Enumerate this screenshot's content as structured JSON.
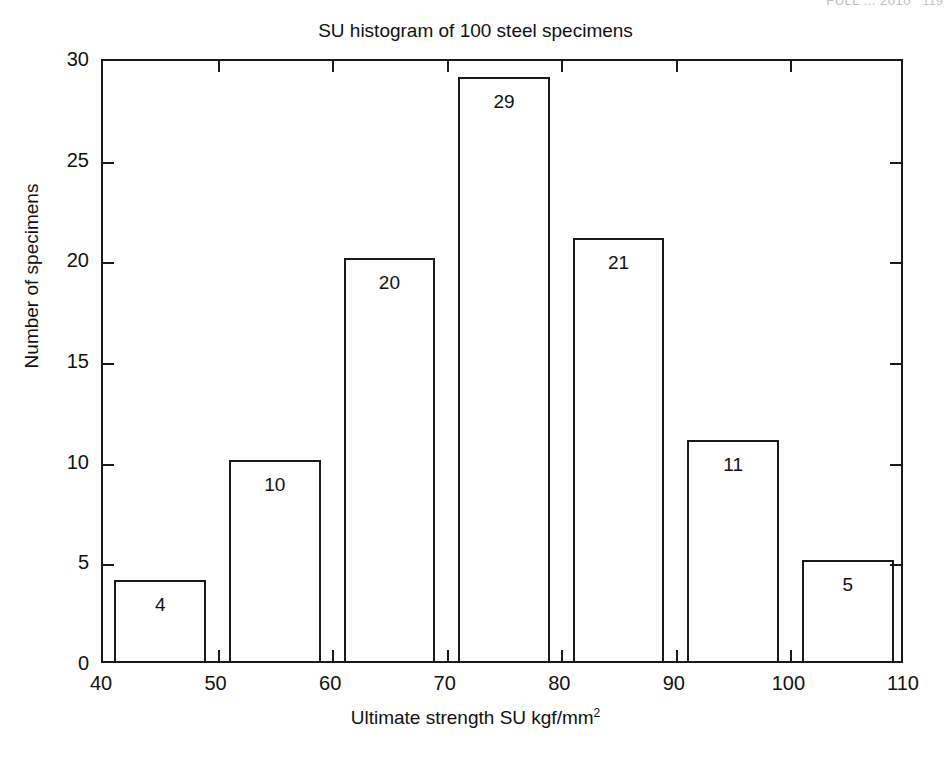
{
  "page_header": {
    "running_head": "FULL ... 2010",
    "page_number": "119"
  },
  "figure": {
    "title": "SU histogram of 100 steel specimens",
    "x_axis_title_main": "Ultimate strength SU kgf/mm",
    "x_axis_title_sup": "2",
    "y_axis_title": "Number of specimens"
  },
  "chart_data": {
    "type": "bar",
    "title": "SU histogram of 100 steel specimens",
    "xlabel": "Ultimate strength SU kgf/mm2",
    "ylabel": "Number of specimens",
    "xlim": [
      40,
      110
    ],
    "ylim": [
      0,
      30
    ],
    "grid": false,
    "legend": null,
    "xticks": [
      40,
      50,
      60,
      70,
      80,
      90,
      100,
      110
    ],
    "xtick_labels": [
      "40",
      "50",
      "60",
      "70",
      "80",
      "90",
      "100",
      "110"
    ],
    "yticks": [
      0,
      5,
      10,
      15,
      20,
      25,
      30
    ],
    "ytick_labels": [
      "0",
      "5",
      "10",
      "15",
      "20",
      "25",
      "30"
    ],
    "bin_edges": [
      41,
      49,
      51,
      59,
      61,
      69,
      71,
      79,
      81,
      89,
      91,
      99,
      101,
      109
    ],
    "categories": [
      "41-49",
      "51-59",
      "61-69",
      "71-79",
      "81-89",
      "91-99",
      "101-109"
    ],
    "values": [
      4,
      10,
      20,
      29,
      21,
      11,
      5
    ],
    "data_labels": [
      "4",
      "10",
      "20",
      "29",
      "21",
      "11",
      "5"
    ],
    "total": 100,
    "bars": [
      {
        "label": "4",
        "value": 4,
        "x_start": 41,
        "x_end": 49
      },
      {
        "label": "10",
        "value": 10,
        "x_start": 51,
        "x_end": 59
      },
      {
        "label": "20",
        "value": 20,
        "x_start": 61,
        "x_end": 69
      },
      {
        "label": "29",
        "value": 29,
        "x_start": 71,
        "x_end": 79
      },
      {
        "label": "21",
        "value": 21,
        "x_start": 81,
        "x_end": 89
      },
      {
        "label": "11",
        "value": 11,
        "x_start": 91,
        "x_end": 99
      },
      {
        "label": "5",
        "value": 5,
        "x_start": 101,
        "x_end": 109
      }
    ],
    "colors": {
      "bar_fill": "#ffffff",
      "bar_edge": "#1a1a1a",
      "axis": "#1a1a1a",
      "background": "#ffffff",
      "text": "#111111"
    }
  }
}
